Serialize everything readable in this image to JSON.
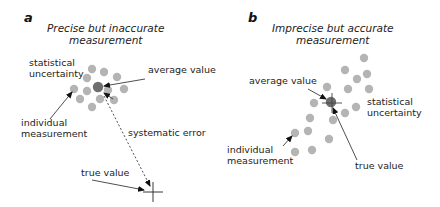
{
  "panels": [
    {
      "letter": "a",
      "title_line1": "Precise but inaccurate",
      "title_line2": "measurement",
      "labels": {
        "statistical_line1": "statistical",
        "statistical_line2": "uncertainty",
        "average": "average value",
        "individual_line1": "individual",
        "individual_line2": "measurement",
        "systematic": "systematic error",
        "true": "true value"
      },
      "dots": [
        [
          92,
          69
        ],
        [
          104,
          72
        ],
        [
          87,
          78
        ],
        [
          117,
          77
        ],
        [
          74,
          89
        ],
        [
          87,
          91
        ],
        [
          108,
          90
        ],
        [
          124,
          89
        ],
        [
          80,
          99
        ],
        [
          100,
          99
        ],
        [
          114,
          100
        ],
        [
          92,
          107
        ]
      ],
      "average_dot": [
        98,
        87
      ],
      "true_cross": [
        152,
        192
      ]
    },
    {
      "letter": "b",
      "title_line1": "Imprecise but accurate",
      "title_line2": "measurement",
      "labels": {
        "average": "average value",
        "statistical_line1": "statistical",
        "statistical_line2": "uncertainty",
        "individual_line1": "individual",
        "individual_line2": "measurement",
        "true": "true value"
      },
      "dots": [
        [
          364,
          58
        ],
        [
          345,
          70
        ],
        [
          367,
          74
        ],
        [
          357,
          79
        ],
        [
          327,
          87
        ],
        [
          348,
          89
        ],
        [
          369,
          89
        ],
        [
          314,
          103
        ],
        [
          356,
          107
        ],
        [
          345,
          113
        ],
        [
          310,
          118
        ],
        [
          333,
          120
        ],
        [
          308,
          131
        ],
        [
          295,
          133
        ],
        [
          329,
          139
        ],
        [
          295,
          152
        ],
        [
          312,
          150
        ]
      ],
      "average_dot": [
        331,
        102
      ],
      "true_cross": [
        331,
        102
      ]
    }
  ],
  "colors": {
    "dot": "#b4b4b4",
    "average_dot": "#6e6e6e",
    "line": "#222222"
  }
}
